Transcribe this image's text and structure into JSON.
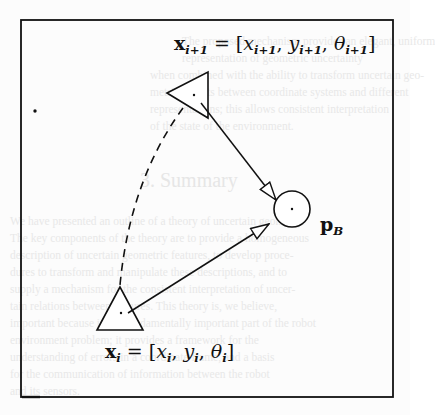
{
  "figure": {
    "labels": {
      "top_pose": {
        "var": "x",
        "sub": "i+1",
        "eq": " = [",
        "c1": "x",
        "c1_sub": "i+1",
        "sep1": ", ",
        "c2": "y",
        "c2_sub": "i+1",
        "sep2": ", ",
        "c3": "θ",
        "c3_sub": "i+1",
        "close": "]"
      },
      "bottom_pose": {
        "var": "x",
        "sub": "i",
        "eq": " = [",
        "c1": "x",
        "c1_sub": "i",
        "sep1": ", ",
        "c2": "y",
        "c2_sub": "i",
        "sep2": ", ",
        "c3": "θ",
        "c3_sub": "i",
        "close": "]"
      },
      "point": {
        "var": "p",
        "sub": "B"
      }
    },
    "elements": {
      "frame": {
        "x": 21,
        "y": 20,
        "w": 372,
        "h": 377
      },
      "upper_triangle": {
        "points": [
          [
            167,
            93
          ],
          [
            208,
            72
          ],
          [
            208,
            118
          ]
        ],
        "center": [
          194,
          95
        ]
      },
      "lower_triangle": {
        "points": [
          [
            120,
            287
          ],
          [
            97,
            330
          ],
          [
            143,
            330
          ]
        ],
        "center": [
          121,
          313
        ]
      },
      "target_circle": {
        "cx": 292,
        "cy": 209,
        "r": 18
      },
      "arrow_upper_to_circle": {
        "from": [
          201,
          103
        ],
        "to": [
          276,
          200
        ]
      },
      "arrow_lower_to_circle": {
        "from": [
          128,
          313
        ],
        "to": [
          269,
          224
        ]
      },
      "dashed_path": {
        "from": [
          183,
          108
        ],
        "to": [
          120,
          285
        ]
      },
      "stray_dot": [
        35,
        111
      ]
    },
    "colors": {
      "ink": "#111111",
      "paper": "#fcfcfc",
      "bleed": "#e8e8e8"
    }
  },
  "bleed_through": {
    "heading": "3. Summary",
    "lines": [
      "The proposed mechanism provides an elegant, uniform",
      "representation of geometric uncertainty",
      "when combined with the ability to transform uncertain geo-",
      "metric objects between coordinate systems and different",
      "representations; this allows consistent interpretation",
      "of the state of the environment.",
      "We have presented an outline of a theory of uncertain geometry.",
      "The key components of the theory are to provide a homogeneous",
      "description of uncertain geometric features, to develop proce-",
      "dures to transform and manipulate these descriptions, and to",
      "supply a mechanism for the consistent interpretation of uncer-",
      "tain relations between features. This theory is, we believe,",
      "important because it is a fundamentally important part of the robot",
      "environment problem; it provides a framework for the",
      "understanding of errors in a coordinate frame, and a basis",
      "for the communication of information between the robot",
      "and its sensors."
    ]
  }
}
